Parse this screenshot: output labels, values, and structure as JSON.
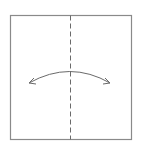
{
  "diagram": {
    "type": "origami-fold-step",
    "paper": {
      "x": 10,
      "y": 15,
      "width": 121,
      "height": 124,
      "stroke": "#8a8a8a"
    },
    "fold_line": {
      "style": "valley-dashed",
      "x": 70,
      "y1": 15,
      "y2": 139,
      "stroke": "#6a6a6a"
    },
    "arrow": {
      "type": "double-headed-curved",
      "from": [
        29,
        83
      ],
      "to": [
        110,
        83
      ],
      "apex": [
        70,
        71
      ],
      "stroke": "#6a6a6a"
    }
  }
}
